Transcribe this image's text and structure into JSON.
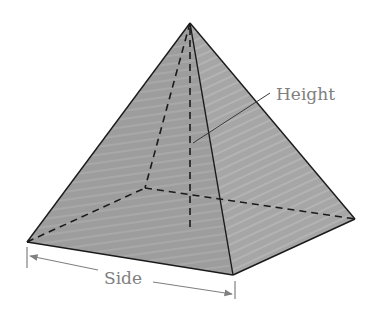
{
  "figure": {
    "labels": {
      "height": "Height",
      "side": "Side"
    },
    "colors": {
      "front_face": "#9a9a9a",
      "right_face": "#a9a9a9",
      "edge": "#1a1a1a",
      "dashed_edge": "#1a1a1a",
      "annotation": "#808080",
      "background": "#ffffff"
    },
    "vertices": {
      "apex": [
        190,
        23
      ],
      "front_left": [
        27,
        242
      ],
      "front_right": [
        233,
        275
      ],
      "back_right": [
        355,
        219
      ],
      "back_left_hidden": [
        145,
        188
      ],
      "height_foot": [
        190,
        231
      ]
    }
  }
}
